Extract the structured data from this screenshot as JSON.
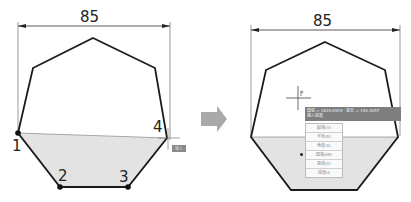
{
  "left_panel": {
    "dimension": "85",
    "points": [
      {
        "label": "1"
      },
      {
        "label": "2"
      },
      {
        "label": "3"
      },
      {
        "label": "4"
      }
    ],
    "tooltip_badge": "输入"
  },
  "arrow": {
    "icon": "arrow-right-icon",
    "color": "#a9a9a9"
  },
  "right_panel": {
    "dimension": "85",
    "tooltip": {
      "line1": "圆弧 = 1819.0919 · 弧长 = 190.4057",
      "line2": "输入弧度"
    },
    "menu": {
      "items": [
        {
          "label": "起端(O)",
          "selected": false
        },
        {
          "label": "半径(R)",
          "selected": false
        },
        {
          "label": "角度(A)",
          "selected": false
        },
        {
          "label": "圆端(AR)",
          "selected": true
        },
        {
          "label": "弧线(V)",
          "selected": false
        },
        {
          "label": "插值(I)",
          "selected": false
        }
      ]
    }
  },
  "colors": {
    "fill": "#e3e3e3",
    "stroke": "#1a1a1a",
    "tooltip_bg": "#7e7e7e"
  }
}
